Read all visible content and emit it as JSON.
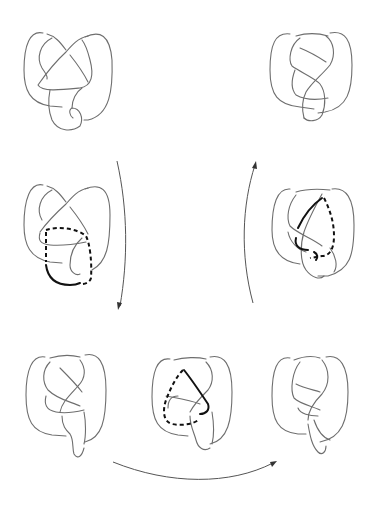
{
  "figure": {
    "colors": {
      "strand": "#6e6e6e",
      "highlight": "#111111",
      "arrow": "#555555",
      "background": "#ffffff"
    },
    "knots": [
      {
        "id": "knot-top-left",
        "position": "row1-left",
        "highlight": "none"
      },
      {
        "id": "knot-top-right",
        "position": "row1-right",
        "highlight": "none"
      },
      {
        "id": "knot-middle-left",
        "position": "row2-left",
        "highlight": "solid+dashed arc"
      },
      {
        "id": "knot-middle-right",
        "position": "row2-right",
        "highlight": "solid+dashed arc"
      },
      {
        "id": "knot-bottom-left",
        "position": "row3-left",
        "highlight": "none"
      },
      {
        "id": "knot-bottom-center",
        "position": "row3-center",
        "highlight": "solid+dashed arc"
      },
      {
        "id": "knot-bottom-right",
        "position": "row3-right",
        "highlight": "none"
      }
    ],
    "arrows": [
      {
        "id": "arrow-down-left",
        "direction": "down"
      },
      {
        "id": "arrow-bottom-right",
        "direction": "right"
      },
      {
        "id": "arrow-up-right",
        "direction": "up"
      }
    ]
  }
}
